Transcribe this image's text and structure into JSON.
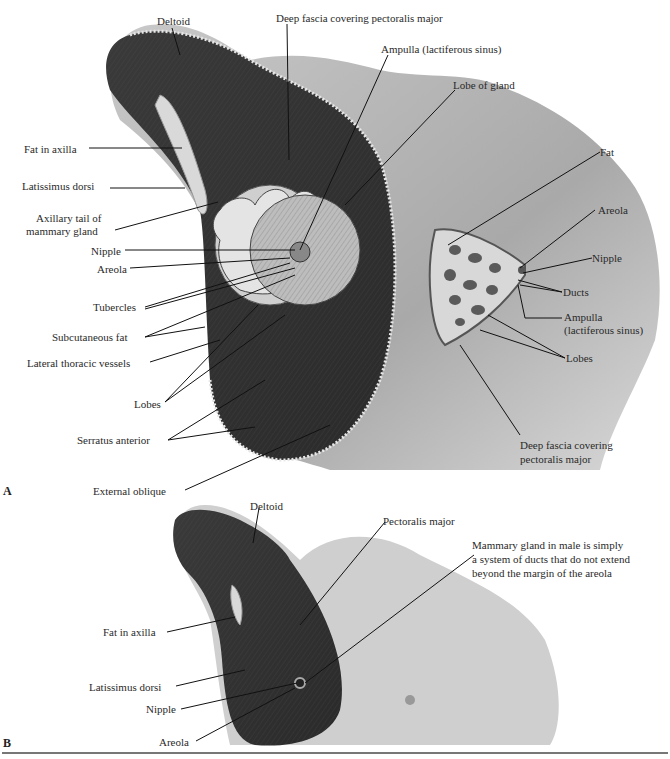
{
  "figure_a": {
    "letter": "A",
    "labels": {
      "deltoid": "Deltoid",
      "deep_fascia_top": "Deep fascia covering pectoralis major",
      "ampulla_top": "Ampulla (lactiferous sinus)",
      "lobe_of_gland": "Lobe of gland",
      "fat_in_axilla": "Fat in axilla",
      "latissimus_dorsi": "Latissimus dorsi",
      "axillary_tail_1": "Axillary tail of",
      "axillary_tail_2": "mammary gland",
      "nipple_left": "Nipple",
      "areola_left": "Areola",
      "tubercles": "Tubercles",
      "subcutaneous_fat": "Subcutaneous fat",
      "lateral_thoracic_vessels": "Lateral thoracic vessels",
      "lobes_left": "Lobes",
      "serratus_anterior": "Serratus anterior",
      "external_oblique": "External oblique",
      "fat_right": "Fat",
      "areola_right": "Areola",
      "nipple_right": "Nipple",
      "ducts": "Ducts",
      "ampulla_right_1": "Ampulla",
      "ampulla_right_2": "(lactiferous sinus)",
      "lobes_right": "Lobes",
      "deep_fascia_bottom_1": "Deep fascia covering",
      "deep_fascia_bottom_2": "pectoralis major"
    }
  },
  "figure_b": {
    "letter": "B",
    "labels": {
      "deltoid": "Deltoid",
      "pectoralis_major": "Pectoralis major",
      "male_note_1": "Mammary gland in male is simply",
      "male_note_2": "a system of ducts that do not extend",
      "male_note_3": "beyond the margin of the areola",
      "fat_in_axilla": "Fat in axilla",
      "latissimus_dorsi": "Latissimus dorsi",
      "nipple": "Nipple",
      "areola": "Areola"
    }
  }
}
